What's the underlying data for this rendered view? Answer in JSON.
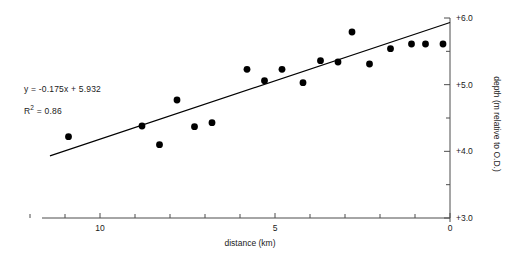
{
  "chart_data": {
    "type": "scatter",
    "title": "",
    "xlabel": "distance (km)",
    "ylabel": "depth (m relative to O.D.)",
    "xlim": [
      12.9,
      0
    ],
    "ylim": [
      3.0,
      6.0
    ],
    "x_reversed": true,
    "grid": false,
    "legend": null,
    "x_ticks": [
      {
        "value": 12,
        "label": ""
      },
      {
        "value": 11,
        "label": ""
      },
      {
        "value": 10,
        "label": "10"
      },
      {
        "value": 9,
        "label": ""
      },
      {
        "value": 8,
        "label": ""
      },
      {
        "value": 7,
        "label": ""
      },
      {
        "value": 6,
        "label": ""
      },
      {
        "value": 5,
        "label": "5"
      },
      {
        "value": 4,
        "label": ""
      },
      {
        "value": 3,
        "label": ""
      },
      {
        "value": 2,
        "label": ""
      },
      {
        "value": 1,
        "label": ""
      },
      {
        "value": 0,
        "label": "0"
      }
    ],
    "y_ticks": [
      {
        "value": 6.0,
        "label": "+6.0"
      },
      {
        "value": 5.5,
        "label": ""
      },
      {
        "value": 5.0,
        "label": "+5.0"
      },
      {
        "value": 4.5,
        "label": ""
      },
      {
        "value": 4.0,
        "label": "+4.0"
      },
      {
        "value": 3.5,
        "label": ""
      },
      {
        "value": 3.0,
        "label": "+3.0"
      }
    ],
    "series": [
      {
        "name": "observations",
        "marker": "filled-circle",
        "color": "#000000",
        "points": [
          {
            "x": 10.9,
            "y": 4.22
          },
          {
            "x": 8.8,
            "y": 4.38
          },
          {
            "x": 8.3,
            "y": 4.1
          },
          {
            "x": 7.8,
            "y": 4.77
          },
          {
            "x": 7.3,
            "y": 4.37
          },
          {
            "x": 6.8,
            "y": 4.43
          },
          {
            "x": 6.3,
            "y": 6.56
          },
          {
            "x": 5.8,
            "y": 5.23
          },
          {
            "x": 5.3,
            "y": 5.06
          },
          {
            "x": 4.8,
            "y": 5.23
          },
          {
            "x": 4.2,
            "y": 5.03
          },
          {
            "x": 3.7,
            "y": 5.36
          },
          {
            "x": 3.2,
            "y": 5.34
          },
          {
            "x": 2.8,
            "y": 5.79
          },
          {
            "x": 2.3,
            "y": 5.31
          },
          {
            "x": 1.7,
            "y": 5.54
          },
          {
            "x": 1.1,
            "y": 5.61
          },
          {
            "x": 0.7,
            "y": 5.61
          },
          {
            "x": 0.2,
            "y": 5.61
          }
        ]
      }
    ],
    "trendline": {
      "equation": "y = -0.175x + 5.932",
      "slope": -0.175,
      "intercept": 5.932,
      "r_squared": 0.86,
      "r_squared_label": "R² = 0.86",
      "x_start": 11.43,
      "x_end": 0.0
    },
    "annotations": [
      {
        "name": "equation",
        "text": "y = -0.175x + 5.932"
      },
      {
        "name": "r-squared",
        "text": "R",
        "superscript": "2",
        "rest": " = 0.86"
      }
    ]
  },
  "labels": {
    "equation": "y = -0.175x + 5.932",
    "r2_prefix": "R",
    "r2_sup": "2",
    "r2_suffix": " = 0.86",
    "x_axis_title": "distance (km)",
    "y_axis_title": "depth (m relative to O.D.)",
    "x_tick_10": "10",
    "x_tick_5": "5",
    "x_tick_0": "0",
    "y_tick_6": "+6.0",
    "y_tick_5": "+5.0",
    "y_tick_4": "+4.0",
    "y_tick_3": "+3.0"
  },
  "colors": {
    "marker": "#000000",
    "axis": "#4d4d4d",
    "trendline": "#000000",
    "text": "#1a1a1a",
    "background": "#ffffff"
  }
}
